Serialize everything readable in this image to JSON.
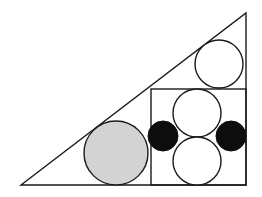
{
  "figure": {
    "canvas": {
      "width": 262,
      "height": 197,
      "background": "#ffffff"
    },
    "style": {
      "stroke": "#1a1a1a",
      "stroke_width": 1.4,
      "fill_white": "#ffffff",
      "fill_gray": "#d3d3d3",
      "fill_black": "#0d0d0d"
    },
    "triangle": {
      "label": "right-triangle",
      "points": "21,185 246,185 246,13",
      "vertices": [
        {
          "name": "bottom-left",
          "x": 21,
          "y": 185
        },
        {
          "name": "bottom-right",
          "x": 246,
          "y": 185
        },
        {
          "name": "top-right",
          "x": 246,
          "y": 13
        }
      ],
      "fill": "none"
    },
    "square": {
      "label": "inscribed-square",
      "x": 151,
      "y": 89,
      "width": 95,
      "height": 96,
      "fill": "none"
    },
    "circles": [
      {
        "name": "top-white-circle",
        "cx": 219,
        "cy": 64,
        "r": 24,
        "fill": "#ffffff",
        "shade": "white"
      },
      {
        "name": "gray-circle",
        "cx": 116,
        "cy": 153,
        "r": 32,
        "fill": "#d3d3d3",
        "shade": "gray"
      },
      {
        "name": "square-upper-white-circle",
        "cx": 197,
        "cy": 113,
        "r": 24,
        "fill": "#ffffff",
        "shade": "white"
      },
      {
        "name": "square-lower-white-circle",
        "cx": 197,
        "cy": 161,
        "r": 24,
        "fill": "#ffffff",
        "shade": "white"
      },
      {
        "name": "left-black-circle",
        "cx": 163,
        "cy": 136,
        "r": 15,
        "fill": "#0d0d0d",
        "shade": "black"
      },
      {
        "name": "right-black-circle",
        "cx": 231,
        "cy": 136,
        "r": 15,
        "fill": "#0d0d0d",
        "shade": "black"
      }
    ]
  }
}
